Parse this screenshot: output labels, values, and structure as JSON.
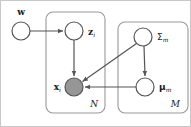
{
  "figure": {
    "type": "plate-notation-graphical-model",
    "background_color": "#ffffff",
    "border_color": "#c8c8c8",
    "edge_color": "#555555",
    "node_stroke_color": "#555555",
    "node_fill_unobserved": "#ffffff",
    "node_fill_observed": "#969696",
    "plate_stroke_color": "#999999"
  },
  "nodes": [
    {
      "id": "w",
      "label": "w",
      "subscript": "",
      "style": "bold-roman",
      "observed": false,
      "cx": 21,
      "cy": 31,
      "r": 9,
      "label_x": 21,
      "label_y": 12,
      "label_anchor": "middle"
    },
    {
      "id": "z",
      "label": "z",
      "subscript": "i",
      "style": "bold-roman",
      "observed": false,
      "cx": 74,
      "cy": 31,
      "r": 9,
      "label_x": 88,
      "label_y": 31,
      "label_anchor": "start"
    },
    {
      "id": "x",
      "label": "x",
      "subscript": "i",
      "style": "bold-roman",
      "observed": true,
      "cx": 74,
      "cy": 87,
      "r": 9,
      "label_x": 60,
      "label_y": 86,
      "label_anchor": "end"
    },
    {
      "id": "Sigma",
      "label": "Σ",
      "subscript": "m",
      "style": "greek",
      "observed": false,
      "cx": 143,
      "cy": 37,
      "r": 9,
      "label_x": 157,
      "label_y": 36,
      "label_anchor": "start"
    },
    {
      "id": "mu",
      "label": "μ",
      "subscript": "m",
      "style": "greek-bold",
      "observed": false,
      "cx": 145,
      "cy": 87,
      "r": 9,
      "label_x": 159,
      "label_y": 87,
      "label_anchor": "start"
    }
  ],
  "edges": [
    {
      "id": "w-to-z",
      "from": "w",
      "to": "z",
      "kind": "horizontal"
    },
    {
      "id": "z-to-x",
      "from": "z",
      "to": "x",
      "kind": "vertical"
    },
    {
      "id": "sigma-to-x",
      "from": "Sigma",
      "to": "x",
      "kind": "diagonal"
    },
    {
      "id": "sigma-to-mu",
      "from": "Sigma",
      "to": "mu",
      "kind": "vertical"
    },
    {
      "id": "mu-to-x",
      "from": "mu",
      "to": "x",
      "kind": "horizontal"
    }
  ],
  "plates": [
    {
      "id": "plate-N",
      "label": "N",
      "x": 46,
      "y": 12,
      "width": 59,
      "height": 101,
      "rx": 7,
      "label_x": 98,
      "label_y": 104
    },
    {
      "id": "plate-M",
      "label": "M",
      "x": 118,
      "y": 22,
      "width": 70,
      "height": 91,
      "rx": 7,
      "label_x": 180,
      "label_y": 104
    }
  ],
  "caption": {
    "alt": "Plate diagram: w points to z_i; z_i points to x_i; Sigma_m points to x_i and to mu_m; mu_m points to x_i. Plate N encloses z_i and x_i. Plate M encloses Sigma_m and mu_m. x_i is shaded (observed)."
  }
}
